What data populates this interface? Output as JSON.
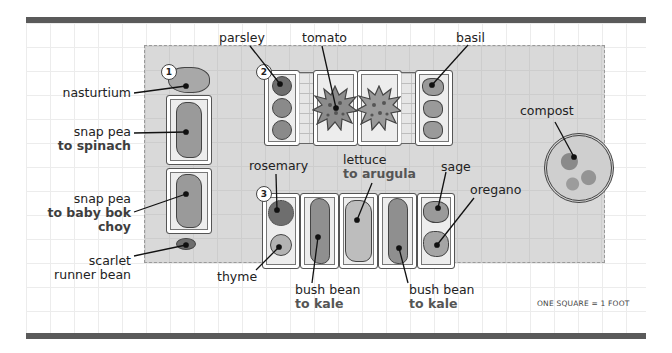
{
  "diagram": {
    "type": "garden-plan",
    "scale_note": "ONE SQUARE = 1 FOOT",
    "beds": [
      {
        "id": "1",
        "badge": "1"
      },
      {
        "id": "2",
        "badge": "2"
      },
      {
        "id": "3",
        "badge": "3"
      }
    ],
    "labels": {
      "nasturtium": {
        "main": "nasturtium"
      },
      "snap_pea_spinach": {
        "main": "snap pea",
        "sub": "to spinach"
      },
      "snap_pea_bokchoy": {
        "main": "snap pea",
        "sub1": "to baby bok",
        "sub2": "choy"
      },
      "scarlet_runner": {
        "main": "scarlet",
        "sub": "runner bean"
      },
      "parsley": {
        "main": "parsley"
      },
      "tomato": {
        "main": "tomato"
      },
      "basil": {
        "main": "basil"
      },
      "compost": {
        "main": "compost"
      },
      "rosemary": {
        "main": "rosemary"
      },
      "lettuce": {
        "main": "lettuce",
        "sub": "to arugula"
      },
      "sage": {
        "main": "sage"
      },
      "oregano": {
        "main": "oregano"
      },
      "thyme": {
        "main": "thyme"
      },
      "bush_bean_1": {
        "main": "bush bean",
        "sub": "to kale"
      },
      "bush_bean_2": {
        "main": "bush bean",
        "sub": "to kale"
      }
    }
  }
}
